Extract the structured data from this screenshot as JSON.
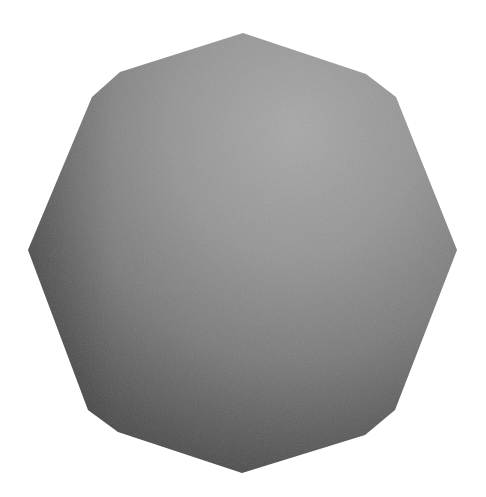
{
  "scene": {
    "subject": "shaded polygonal sphere",
    "background": "#ffffff",
    "colors": {
      "highlight": "#a4a4a4",
      "mid": "#858585",
      "shadow": "#3c3c3c",
      "edge_dark": "#2e2e2e"
    },
    "outline_points": "243,33 120,72 92,97 28,250 88,410 118,432 242,473 365,435 395,410 457,250 396,97 366,74",
    "highlight_center": {
      "cx": "0.62",
      "cy": "0.22"
    }
  }
}
